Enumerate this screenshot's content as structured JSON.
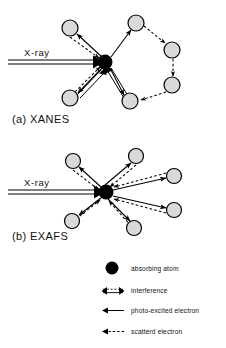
{
  "figure": {
    "background": "#ffffff",
    "ink": "#000000",
    "atom_fill": "#d9d9d9",
    "atom_stroke": "#000000",
    "absorber_fill": "#000000",
    "panels": [
      {
        "id": "xanes",
        "caption": "(a) XANES",
        "caption_pos": {
          "x": 12,
          "y": 123
        },
        "xray_label": "X-ray",
        "xray_label_pos": {
          "x": 24,
          "y": 56
        },
        "beam": {
          "x1": 8,
          "y1": 62,
          "x2": 100,
          "y2": 62
        },
        "center": {
          "x": 105,
          "y": 62,
          "r": 7.5
        },
        "atoms": [
          {
            "name": "atom-upper-left",
            "x": 70,
            "y": 28,
            "r": 8
          },
          {
            "name": "atom-lower-left",
            "x": 70,
            "y": 98,
            "r": 8
          },
          {
            "name": "atom-top",
            "x": 136,
            "y": 23,
            "r": 8
          },
          {
            "name": "atom-right-upper",
            "x": 172,
            "y": 50,
            "r": 8
          },
          {
            "name": "atom-right-lower",
            "x": 172,
            "y": 85,
            "r": 8
          },
          {
            "name": "atom-bottom",
            "x": 130,
            "y": 101,
            "r": 8
          }
        ]
      },
      {
        "id": "exafs",
        "caption": "(b) EXAFS",
        "caption_pos": {
          "x": 12,
          "y": 240
        },
        "xray_label": "X-ray",
        "xray_label_pos": {
          "x": 24,
          "y": 186
        },
        "beam": {
          "x1": 8,
          "y1": 192,
          "x2": 100,
          "y2": 192
        },
        "center": {
          "x": 106,
          "y": 192,
          "r": 7.5
        },
        "atoms": [
          {
            "name": "atom-upper-left",
            "x": 73,
            "y": 161,
            "r": 7.5
          },
          {
            "name": "atom-top-right",
            "x": 136,
            "y": 156,
            "r": 7.5
          },
          {
            "name": "atom-right-upper",
            "x": 174,
            "y": 176,
            "r": 7.5
          },
          {
            "name": "atom-right-lower",
            "x": 174,
            "y": 210,
            "r": 7.5
          },
          {
            "name": "atom-bottom-right",
            "x": 134,
            "y": 228,
            "r": 7.5
          },
          {
            "name": "atom-lower-left",
            "x": 72,
            "y": 221,
            "r": 7.5
          }
        ]
      }
    ]
  },
  "legend": {
    "items": [
      {
        "id": "absorbing-atom",
        "symbol": "filled-circle",
        "label": "absorbing atom",
        "y": 268
      },
      {
        "id": "interference",
        "symbol": "double-arrow-solid-dashed",
        "label": "interference",
        "y": 291
      },
      {
        "id": "photo-excited-electron",
        "symbol": "solid-arrow",
        "label": "photo-excited electron",
        "y": 311
      },
      {
        "id": "scattered-electron",
        "symbol": "dashed-arrow",
        "label": "scatterd electron",
        "y": 332
      }
    ]
  }
}
